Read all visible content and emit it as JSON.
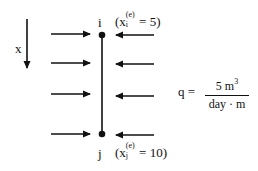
{
  "diagram": {
    "type": "1D element with distributed flux",
    "axis": {
      "label": "x",
      "direction": "down"
    },
    "element": {
      "node_i": {
        "label": "i",
        "coord_label": "(x",
        "coord_sub": "i",
        "coord_sup": "(e)",
        "coord_value": "= 5)",
        "x_value": 5
      },
      "node_j": {
        "label": "j",
        "coord_label": "(x",
        "coord_sub": "j",
        "coord_sup": "(e)",
        "coord_value": "= 10)",
        "x_value": 10
      }
    },
    "left_arrows": {
      "count": 4,
      "direction": "right"
    },
    "right_arrows": {
      "count": 4,
      "direction": "left"
    },
    "equation": {
      "lhs": "q =",
      "numerator": "5 m",
      "numerator_sup": "3",
      "denominator": "day · m"
    }
  }
}
